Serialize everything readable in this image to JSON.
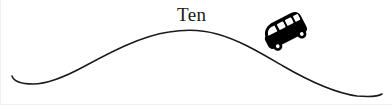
{
  "figure": {
    "title_label": "Ten",
    "background_color": "#ffffff",
    "line_color": "#1a1a1a",
    "vehicle_color": "#000000",
    "vehicle_window_color": "#ffffff",
    "width": 392,
    "height": 105
  },
  "road": {
    "name": "hill-curve",
    "stroke_width": 1.5,
    "path": "M 11,76 C 13,82 20,84 32,84 C 46,84 62,78 84,66 C 110,52 140,36 168,32 C 186,29 202,30 216,34 C 238,40 258,52 282,66 C 308,81 334,93 356,96 C 368,97 376,97 381,94"
  },
  "label": {
    "text": "Ten",
    "x": 176,
    "y": 21,
    "font_size": 19
  },
  "vehicle": {
    "type": "van",
    "rotation_deg": -27,
    "center_x": 284,
    "center_y": 33,
    "window_count": 4,
    "wheel_count": 2
  }
}
